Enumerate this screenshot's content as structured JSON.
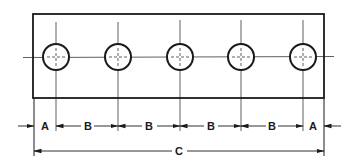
{
  "diagram": {
    "type": "engineering-drawing",
    "plate": {
      "x": 33,
      "y": 14,
      "width": 291,
      "height": 84
    },
    "holes": [
      {
        "cx": 56,
        "cy": 57,
        "r": 13
      },
      {
        "cx": 118,
        "cy": 57,
        "r": 13
      },
      {
        "cx": 180,
        "cy": 57,
        "r": 13
      },
      {
        "cx": 241,
        "cy": 57,
        "r": 13
      },
      {
        "cx": 303,
        "cy": 57,
        "r": 13
      }
    ],
    "colors": {
      "line": "#1a1a1a",
      "background": "#ffffff"
    },
    "dimensions": {
      "edge_left": "A",
      "spacing_1": "B",
      "spacing_2": "B",
      "spacing_3": "B",
      "spacing_4": "B",
      "edge_right": "A",
      "overall": "C"
    }
  }
}
